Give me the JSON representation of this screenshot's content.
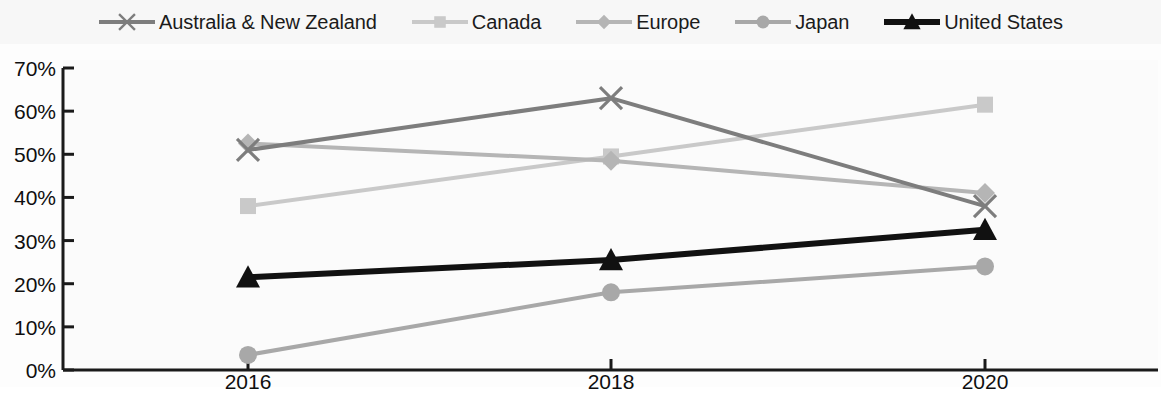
{
  "chart_data": {
    "type": "line",
    "title": "",
    "subtitle": "",
    "xlabel": "",
    "ylabel": "",
    "categories": [
      "2016",
      "2018",
      "2020"
    ],
    "x": [
      2016,
      2018,
      2020
    ],
    "ylim": [
      0,
      70
    ],
    "ytick_labels": [
      "0%",
      "10%",
      "20%",
      "30%",
      "40%",
      "50%",
      "60%",
      "70%"
    ],
    "ytick_values": [
      0,
      10,
      20,
      30,
      40,
      50,
      60,
      70
    ],
    "grid": false,
    "legend_position": "top",
    "value_suffix": "%",
    "series": [
      {
        "name": "Australia & New Zealand",
        "marker": "x-cross",
        "color": "#7d7d7d",
        "line_width": 4,
        "values": [
          51,
          63,
          38
        ]
      },
      {
        "name": "Canada",
        "marker": "square",
        "color": "#c9c9c9",
        "line_width": 4,
        "values": [
          38,
          49.5,
          61.5
        ]
      },
      {
        "name": "Europe",
        "marker": "diamond",
        "color": "#b5b5b5",
        "line_width": 4,
        "values": [
          52.5,
          48.5,
          41
        ]
      },
      {
        "name": "Japan",
        "marker": "circle",
        "color": "#a8a8a8",
        "line_width": 4,
        "values": [
          3.5,
          18,
          24
        ]
      },
      {
        "name": "United States",
        "marker": "triangle",
        "color": "#111111",
        "line_width": 6,
        "values": [
          21.5,
          25.5,
          32.5
        ]
      }
    ]
  },
  "legend": {
    "items": [
      {
        "label": "Australia & New Zealand",
        "icon": "x-cross-marker-icon"
      },
      {
        "label": "Canada",
        "icon": "square-marker-icon"
      },
      {
        "label": "Europe",
        "icon": "diamond-marker-icon"
      },
      {
        "label": "Japan",
        "icon": "circle-marker-icon"
      },
      {
        "label": "United States",
        "icon": "triangle-marker-icon"
      }
    ]
  },
  "axes": {
    "y": {
      "labels": [
        "70%",
        "60%",
        "50%",
        "40%",
        "30%",
        "20%",
        "10%",
        "0%"
      ]
    },
    "x": {
      "labels": [
        "2016",
        "2018",
        "2020"
      ]
    }
  },
  "colors": {
    "axis": "#1a1a1a",
    "plot_background": "#fbfbfb",
    "legend_background": "#f7f7f7",
    "text": "#0f0f0f"
  }
}
